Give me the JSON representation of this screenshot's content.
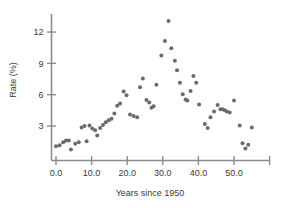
{
  "chart_data": {
    "type": "scatter",
    "title": "",
    "xlabel": "Years since 1950",
    "ylabel": "Rate (%)",
    "xlim": [
      -2.5,
      62
    ],
    "ylim": [
      0.0,
      13.8
    ],
    "grid": false,
    "legend": null,
    "x_ticks": [
      0.0,
      10.0,
      20.0,
      30.0,
      40.0,
      50.0,
      60.0
    ],
    "x_tick_labels": [
      "0.0",
      "10.0",
      "20.0",
      "30.0",
      "40.0",
      "50.0",
      ""
    ],
    "y_ticks": [
      3,
      6,
      9,
      12
    ],
    "y_tick_labels": [
      "3",
      "6",
      "9",
      "12"
    ],
    "marker": "circle",
    "marker_color": "#6b6b6b",
    "marker_size": 3.0,
    "points": [
      {
        "x": 0.0,
        "y": 1.05
      },
      {
        "x": 1.0,
        "y": 1.15
      },
      {
        "x": 2.0,
        "y": 1.45
      },
      {
        "x": 2.8,
        "y": 1.6
      },
      {
        "x": 3.6,
        "y": 1.62
      },
      {
        "x": 4.2,
        "y": 0.75
      },
      {
        "x": 5.4,
        "y": 1.3
      },
      {
        "x": 6.4,
        "y": 1.45
      },
      {
        "x": 7.2,
        "y": 2.85
      },
      {
        "x": 8.0,
        "y": 3.0
      },
      {
        "x": 8.6,
        "y": 1.55
      },
      {
        "x": 9.4,
        "y": 3.05
      },
      {
        "x": 10.2,
        "y": 2.75
      },
      {
        "x": 11.0,
        "y": 2.6
      },
      {
        "x": 11.6,
        "y": 2.1
      },
      {
        "x": 12.4,
        "y": 2.8
      },
      {
        "x": 13.2,
        "y": 3.1
      },
      {
        "x": 14.0,
        "y": 3.35
      },
      {
        "x": 14.8,
        "y": 3.55
      },
      {
        "x": 15.6,
        "y": 3.7
      },
      {
        "x": 16.4,
        "y": 4.2
      },
      {
        "x": 17.2,
        "y": 4.95
      },
      {
        "x": 18.0,
        "y": 5.15
      },
      {
        "x": 19.0,
        "y": 6.3
      },
      {
        "x": 19.8,
        "y": 5.95
      },
      {
        "x": 20.8,
        "y": 4.1
      },
      {
        "x": 21.8,
        "y": 3.95
      },
      {
        "x": 22.8,
        "y": 3.85
      },
      {
        "x": 23.6,
        "y": 6.7
      },
      {
        "x": 24.4,
        "y": 7.55
      },
      {
        "x": 25.4,
        "y": 5.5
      },
      {
        "x": 26.2,
        "y": 5.25
      },
      {
        "x": 26.8,
        "y": 4.75
      },
      {
        "x": 27.4,
        "y": 4.9
      },
      {
        "x": 28.2,
        "y": 6.95
      },
      {
        "x": 29.6,
        "y": 9.75
      },
      {
        "x": 30.6,
        "y": 11.15
      },
      {
        "x": 31.6,
        "y": 13.05
      },
      {
        "x": 32.4,
        "y": 10.45
      },
      {
        "x": 33.4,
        "y": 9.25
      },
      {
        "x": 34.0,
        "y": 8.35
      },
      {
        "x": 34.8,
        "y": 7.15
      },
      {
        "x": 35.6,
        "y": 6.05
      },
      {
        "x": 36.4,
        "y": 5.55
      },
      {
        "x": 36.9,
        "y": 5.45
      },
      {
        "x": 37.8,
        "y": 6.35
      },
      {
        "x": 38.6,
        "y": 7.8
      },
      {
        "x": 39.4,
        "y": 7.15
      },
      {
        "x": 40.2,
        "y": 5.05
      },
      {
        "x": 41.8,
        "y": 3.2
      },
      {
        "x": 42.6,
        "y": 2.8
      },
      {
        "x": 43.4,
        "y": 3.85
      },
      {
        "x": 44.4,
        "y": 4.4
      },
      {
        "x": 45.4,
        "y": 5.0
      },
      {
        "x": 46.2,
        "y": 4.6
      },
      {
        "x": 46.8,
        "y": 4.6
      },
      {
        "x": 47.4,
        "y": 4.5
      },
      {
        "x": 48.0,
        "y": 4.4
      },
      {
        "x": 48.8,
        "y": 4.3
      },
      {
        "x": 50.0,
        "y": 5.45
      },
      {
        "x": 51.6,
        "y": 3.05
      },
      {
        "x": 52.4,
        "y": 1.35
      },
      {
        "x": 53.2,
        "y": 0.85
      },
      {
        "x": 54.0,
        "y": 1.2
      },
      {
        "x": 55.0,
        "y": 2.85
      }
    ]
  },
  "axes": {
    "y_axis_title": "Rate (%)",
    "x_axis_title": "Years since 1950"
  }
}
